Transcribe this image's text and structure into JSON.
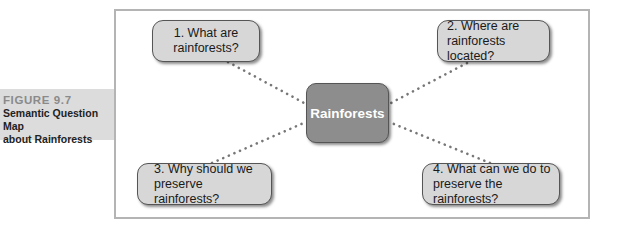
{
  "caption": {
    "figure_label": "FIGURE 9.7",
    "title_line1": "Semantic Question Map",
    "title_line2": "about Rainforests"
  },
  "diagram": {
    "center": {
      "label": "Rainforests"
    },
    "questions": [
      {
        "line1": "1. What are",
        "line2": "rainforests?"
      },
      {
        "line1": "2. Where are",
        "line2": "rainforests located?"
      },
      {
        "line1": "3. Why should we",
        "line2": "preserve rainforests?"
      },
      {
        "line1": "4. What can we do to",
        "line2": "preserve the rainforests?"
      }
    ],
    "colors": {
      "question_fill": "#d7d7d7",
      "center_fill": "#8d8d8d",
      "caption_fill": "#dcdcdc",
      "connector": "#777777"
    }
  }
}
